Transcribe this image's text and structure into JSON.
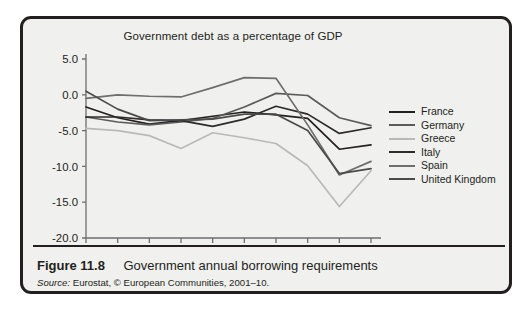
{
  "figure": {
    "number": "Figure 11.8",
    "caption": "Government annual borrowing requirements",
    "source_label": "Source:",
    "source_text": " Eurostat, © European Communities, 2001–10."
  },
  "chart_data": {
    "type": "line",
    "title": "Government debt as a percentage of GDP",
    "xlabel": "",
    "ylabel": "",
    "x": [
      "2001",
      "02",
      "03",
      "04",
      "05",
      "06",
      "07",
      "08",
      "09",
      "10"
    ],
    "tick_labels_x": [
      "2001",
      "02",
      "03",
      "04",
      "05",
      "06",
      "07",
      "08",
      "09",
      "10"
    ],
    "tick_labels_y": [
      "5.0",
      "0.0",
      "-5.0",
      "-10.0",
      "-15.0",
      "-20.0"
    ],
    "ylim": [
      -20.0,
      5.0
    ],
    "yticks": [
      5.0,
      0.0,
      -5.0,
      -10.0,
      -15.0,
      -20.0
    ],
    "grid": false,
    "legend_position": "right",
    "series": [
      {
        "name": "France",
        "color": "#231f20",
        "values": [
          -1.7,
          -3.2,
          -4.1,
          -3.6,
          -3.0,
          -2.4,
          -2.8,
          -3.3,
          -7.6,
          -7.0
        ]
      },
      {
        "name": "Germany",
        "color": "#5b5b5b",
        "values": [
          -3.1,
          -3.8,
          -4.2,
          -3.8,
          -3.3,
          -1.7,
          0.2,
          -0.1,
          -3.2,
          -4.3
        ]
      },
      {
        "name": "Greece",
        "color": "#b9b9b9",
        "values": [
          -4.7,
          -5.0,
          -5.7,
          -7.5,
          -5.3,
          -6.0,
          -6.8,
          -9.9,
          -15.6,
          -10.6
        ]
      },
      {
        "name": "Italy",
        "color": "#2d2a2b",
        "values": [
          -3.1,
          -3.1,
          -3.5,
          -3.6,
          -4.4,
          -3.4,
          -1.6,
          -2.7,
          -5.4,
          -4.6
        ]
      },
      {
        "name": "Spain",
        "color": "#6e6e6e",
        "values": [
          -0.5,
          0.0,
          -0.2,
          -0.3,
          1.0,
          2.4,
          2.3,
          -4.2,
          -11.2,
          -9.3
        ]
      },
      {
        "name": "United Kingdom",
        "color": "#4a4a4a",
        "values": [
          0.5,
          -2.0,
          -3.6,
          -3.5,
          -3.4,
          -2.7,
          -2.7,
          -5.0,
          -11.0,
          -10.3
        ]
      }
    ]
  }
}
